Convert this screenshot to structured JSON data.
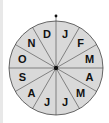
{
  "wheel": {
    "center": [
      56,
      68
    ],
    "radius": 47,
    "fill": "#d9d9d9",
    "stroke": "#444444",
    "segments": [
      "J",
      "F",
      "M",
      "A",
      "M",
      "J",
      "J",
      "A",
      "S",
      "O",
      "N",
      "D"
    ],
    "pointer": "dot at top"
  }
}
